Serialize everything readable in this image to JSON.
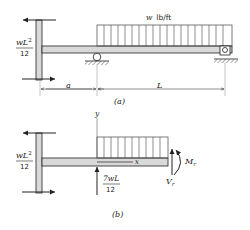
{
  "figure_a": {
    "caption": "(a)",
    "load_label_w": "w",
    "load_label_units": "lb/ft",
    "moment_num": "wL",
    "moment_exp": "2",
    "moment_den": "12",
    "dim_a": "a",
    "dim_L": "L"
  },
  "figure_b": {
    "caption": "(b)",
    "axis_y": "y",
    "axis_x": "x",
    "moment_num": "wL",
    "moment_exp": "2",
    "moment_den": "12",
    "reaction_num": "7wL",
    "reaction_den": "12",
    "shear_label": "V",
    "shear_sub": "r",
    "moment_label": "M",
    "moment_sub": "r"
  },
  "colors": {
    "beam_fill": "#d9d9d9",
    "line": "#222222"
  }
}
